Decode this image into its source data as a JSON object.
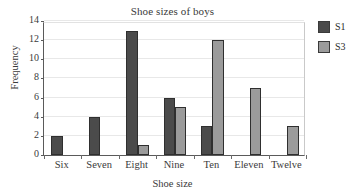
{
  "chart_data": {
    "type": "bar",
    "title": "Shoe sizes of boys",
    "xlabel": "Shoe size",
    "ylabel": "Frequency",
    "categories": [
      "Six",
      "Seven",
      "Eight",
      "Nine",
      "Ten",
      "Eleven",
      "Twelve"
    ],
    "series": [
      {
        "name": "S1",
        "color": "#4b4b4b",
        "values": [
          2,
          4,
          13,
          6,
          3,
          0,
          0
        ]
      },
      {
        "name": "S3",
        "color": "#9b9b9b",
        "values": [
          0,
          0,
          1,
          5,
          12,
          7,
          3
        ]
      }
    ],
    "ylim": [
      0,
      14
    ],
    "yticks": [
      0,
      2,
      4,
      6,
      8,
      10,
      12,
      14
    ],
    "ytick_labels": [
      "0",
      "2",
      "4",
      "6",
      "8",
      "10",
      "12",
      "14"
    ],
    "grid": true,
    "grid_axis": "y",
    "legend_position": "top-right-outside",
    "legend_entries": [
      "S1",
      "S3"
    ],
    "bar_layout": "grouped"
  }
}
